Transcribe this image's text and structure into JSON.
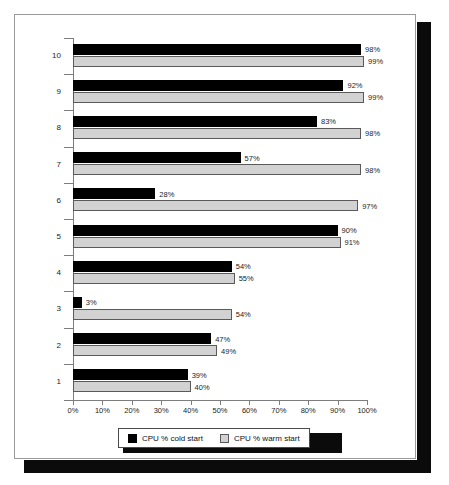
{
  "chart_data": {
    "type": "bar",
    "orientation": "horizontal",
    "title": "",
    "xlabel": "",
    "ylabel": "",
    "xlim": [
      0,
      100
    ],
    "xticks": [
      "0%",
      "10%",
      "20%",
      "30%",
      "40%",
      "50%",
      "60%",
      "70%",
      "80%",
      "90%",
      "100%"
    ],
    "xtick_values": [
      0,
      10,
      20,
      30,
      40,
      50,
      60,
      70,
      80,
      90,
      100
    ],
    "grid": false,
    "legend_position": "bottom",
    "categories": [
      "1",
      "2",
      "3",
      "4",
      "5",
      "6",
      "7",
      "8",
      "9",
      "10"
    ],
    "series": [
      {
        "name": "CPU % cold start",
        "color": "#000000",
        "values": [
          39,
          47,
          3,
          54,
          90,
          28,
          57,
          83,
          92,
          98
        ],
        "labels": [
          "39%",
          "47%",
          "3%",
          "54%",
          "90%",
          "28%",
          "57%",
          "83%",
          "92%",
          "98%"
        ]
      },
      {
        "name": "CPU % warm start",
        "color": "#d2d2d2",
        "values": [
          40,
          49,
          54,
          55,
          91,
          97,
          98,
          98,
          99,
          99
        ],
        "labels": [
          "40%",
          "49%",
          "54%",
          "55%",
          "91%",
          "97%",
          "98%",
          "98%",
          "99%",
          "99%"
        ]
      }
    ]
  },
  "legend": {
    "items": [
      {
        "label": "CPU % cold start",
        "swatch": "cold"
      },
      {
        "label": "CPU % warm start",
        "swatch": "warm"
      }
    ]
  }
}
